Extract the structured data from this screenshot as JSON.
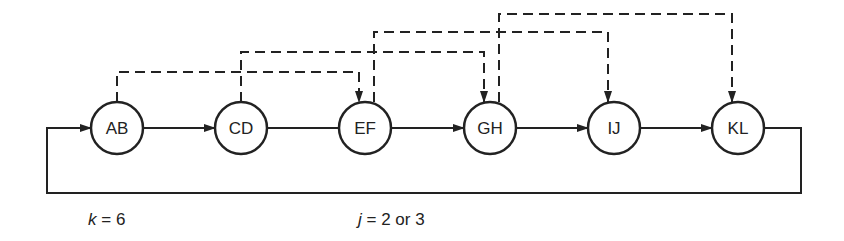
{
  "diagram": {
    "type": "ring-network",
    "colors": {
      "stroke": "#222222",
      "background": "#ffffff"
    },
    "node_radius": 26,
    "nodes": [
      {
        "id": "AB",
        "label": "AB",
        "x": 117,
        "y": 128
      },
      {
        "id": "CD",
        "label": "CD",
        "x": 241,
        "y": 128
      },
      {
        "id": "EF",
        "label": "EF",
        "x": 365,
        "y": 128
      },
      {
        "id": "GH",
        "label": "GH",
        "x": 490,
        "y": 128
      },
      {
        "id": "IJ",
        "label": "IJ",
        "x": 614,
        "y": 128
      },
      {
        "id": "KL",
        "label": "KL",
        "x": 738,
        "y": 128
      }
    ],
    "solid_edges": [
      {
        "from": "AB",
        "to": "CD",
        "arrow": true
      },
      {
        "from": "CD",
        "to": "EF",
        "arrow": false
      },
      {
        "from": "EF",
        "to": "GH",
        "arrow": true
      },
      {
        "from": "GH",
        "to": "IJ",
        "arrow": true
      },
      {
        "from": "IJ",
        "to": "KL",
        "arrow": true
      },
      {
        "from": "KL",
        "to": "AB",
        "arrow": true,
        "route": "loop-back-below"
      }
    ],
    "dashed_edges": [
      {
        "from": "AB",
        "to": "EF",
        "level_y": 72
      },
      {
        "from": "CD",
        "to": "GH",
        "level_y": 52
      },
      {
        "from": "EF",
        "to": "IJ",
        "level_y": 32
      },
      {
        "from": "GH",
        "to": "KL",
        "level_y": 14
      }
    ],
    "loop": {
      "left_x": 47,
      "right_x": 801,
      "bottom_y": 193
    }
  },
  "captions": {
    "k": {
      "var": "k",
      "eq": " = ",
      "value": "6"
    },
    "j": {
      "var": "j",
      "eq": " = ",
      "value": "2 or 3"
    }
  }
}
